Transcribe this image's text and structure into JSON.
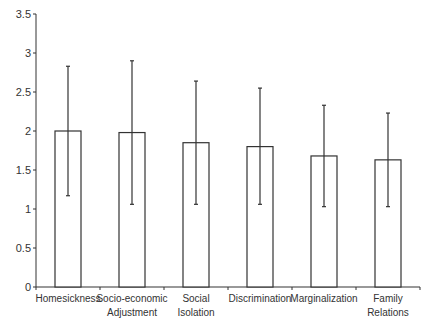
{
  "chart_data": {
    "type": "bar",
    "title": "",
    "xlabel": "",
    "ylabel": "",
    "ylim": [
      0,
      3.5
    ],
    "yticks": [
      0,
      0.5,
      1,
      1.5,
      2,
      2.5,
      3,
      3.5
    ],
    "ytick_labels": [
      "0",
      "0.5",
      "1",
      "1.5",
      "2",
      "2.5",
      "3",
      "3.5"
    ],
    "grid": false,
    "legend": null,
    "categories": [
      "Homesickness",
      "Socio-economic Adjustment",
      "Social Isolation",
      "Discrimination",
      "Marginalization",
      "Family Relations"
    ],
    "category_label_lines": [
      [
        "Homesickness"
      ],
      [
        "Socio-economic",
        "Adjustment"
      ],
      [
        "Social",
        "Isolation"
      ],
      [
        "Discrimination"
      ],
      [
        "Marginalization"
      ],
      [
        "Family",
        "Relations"
      ]
    ],
    "values": [
      2.0,
      1.98,
      1.85,
      1.8,
      1.68,
      1.63
    ],
    "error_upper": [
      2.83,
      2.9,
      2.64,
      2.55,
      2.33,
      2.23
    ],
    "error_lower": [
      1.17,
      1.06,
      1.06,
      1.06,
      1.03,
      1.03
    ],
    "bar_fill": "#ffffff",
    "bar_stroke": "#333333"
  }
}
